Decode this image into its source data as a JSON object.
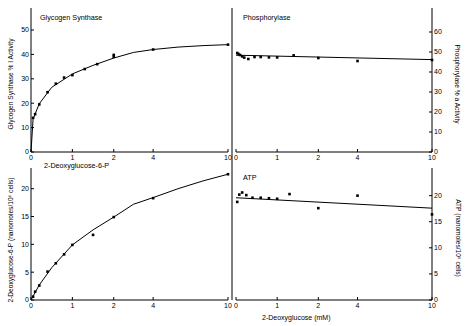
{
  "figure": {
    "background": "#ffffff",
    "ink": "#000000",
    "shared_xlabel": "2-Deoxyglucose (mM)"
  },
  "chart_data": [
    {
      "id": "glycogen-synthase",
      "type": "scatter",
      "title": "Glycogen Synthase",
      "panel": "top-left",
      "xlabel": "2-Deoxyglucose-6-P",
      "ylabel": "Glycogen Synthase % I Activity",
      "xticks": [
        0,
        1,
        2,
        4,
        10
      ],
      "yticks": [
        0,
        10,
        20,
        30,
        40,
        50
      ],
      "xlim": [
        0,
        10
      ],
      "ylim": [
        0,
        50
      ],
      "grid": false,
      "legend": "none",
      "points": [
        {
          "x": 0.05,
          "y": 14.0
        },
        {
          "x": 0.1,
          "y": 15.5
        },
        {
          "x": 0.2,
          "y": 19.5
        },
        {
          "x": 0.4,
          "y": 24.5
        },
        {
          "x": 0.6,
          "y": 28.0
        },
        {
          "x": 0.8,
          "y": 30.5
        },
        {
          "x": 1.0,
          "y": 31.5
        },
        {
          "x": 1.3,
          "y": 34.0
        },
        {
          "x": 1.6,
          "y": 36.0
        },
        {
          "x": 2.0,
          "y": 39.0
        },
        {
          "x": 2.0,
          "y": 39.8
        },
        {
          "x": 4.0,
          "y": 42.0
        },
        {
          "x": 10.0,
          "y": 44.0
        }
      ],
      "curve": [
        {
          "x": 0.0,
          "y": 0.0
        },
        {
          "x": 0.05,
          "y": 13.5
        },
        {
          "x": 0.2,
          "y": 19.8
        },
        {
          "x": 0.5,
          "y": 26.5
        },
        {
          "x": 1.0,
          "y": 32.0
        },
        {
          "x": 1.5,
          "y": 35.5
        },
        {
          "x": 2.0,
          "y": 38.5
        },
        {
          "x": 3.0,
          "y": 40.8
        },
        {
          "x": 4.0,
          "y": 42.0
        },
        {
          "x": 6.0,
          "y": 43.0
        },
        {
          "x": 8.0,
          "y": 43.6
        },
        {
          "x": 10.0,
          "y": 44.0
        }
      ]
    },
    {
      "id": "phosphorylase",
      "type": "scatter",
      "title": "Phosphorylase",
      "panel": "top-right",
      "xlabel": "",
      "ylabel": "Phosphorylase % a Activity",
      "xticks": [
        0,
        1,
        2,
        4,
        10
      ],
      "yticks": [
        0,
        10,
        20,
        30,
        40,
        50,
        60
      ],
      "xlim": [
        0,
        10
      ],
      "ylim": [
        0,
        60
      ],
      "grid": false,
      "legend": "none",
      "points": [
        {
          "x": 0.03,
          "y": 49.5
        },
        {
          "x": 0.06,
          "y": 49.0
        },
        {
          "x": 0.1,
          "y": 48.5
        },
        {
          "x": 0.15,
          "y": 47.8
        },
        {
          "x": 0.2,
          "y": 47.2
        },
        {
          "x": 0.3,
          "y": 46.5
        },
        {
          "x": 0.45,
          "y": 47.5
        },
        {
          "x": 0.6,
          "y": 47.5
        },
        {
          "x": 0.8,
          "y": 47.3
        },
        {
          "x": 1.0,
          "y": 47.3
        },
        {
          "x": 1.4,
          "y": 48.3
        },
        {
          "x": 2.0,
          "y": 47.0
        },
        {
          "x": 4.0,
          "y": 45.5
        },
        {
          "x": 10.0,
          "y": 46.0
        }
      ],
      "curve": [
        {
          "x": 0.0,
          "y": 48.4
        },
        {
          "x": 10.0,
          "y": 46.2
        }
      ]
    },
    {
      "id": "2-deoxyglucose-6-p",
      "type": "scatter",
      "title": "2-Deoxyglucose-6-P",
      "panel": "bottom-left",
      "xlabel": "2-Deoxyglucose (mM)",
      "ylabel": "2-Deoxyglucose-6-P (nanomoles/10⁶ cells)",
      "xticks": [
        0,
        1,
        2,
        4,
        10
      ],
      "yticks": [
        0,
        5,
        10,
        15,
        20
      ],
      "xlim": [
        0,
        10
      ],
      "ylim": [
        0,
        23
      ],
      "grid": false,
      "legend": "none",
      "points": [
        {
          "x": 0.05,
          "y": 0.6
        },
        {
          "x": 0.1,
          "y": 1.5
        },
        {
          "x": 0.2,
          "y": 2.6
        },
        {
          "x": 0.4,
          "y": 5.1
        },
        {
          "x": 0.6,
          "y": 6.6
        },
        {
          "x": 0.8,
          "y": 8.2
        },
        {
          "x": 1.0,
          "y": 9.9
        },
        {
          "x": 1.5,
          "y": 11.7
        },
        {
          "x": 2.0,
          "y": 14.9
        },
        {
          "x": 4.0,
          "y": 18.3
        },
        {
          "x": 10.0,
          "y": 22.6
        }
      ],
      "curve": [
        {
          "x": 0.0,
          "y": 0.0
        },
        {
          "x": 0.2,
          "y": 2.7
        },
        {
          "x": 0.5,
          "y": 5.8
        },
        {
          "x": 1.0,
          "y": 9.9
        },
        {
          "x": 1.5,
          "y": 12.6
        },
        {
          "x": 2.0,
          "y": 14.9
        },
        {
          "x": 3.0,
          "y": 17.2
        },
        {
          "x": 4.0,
          "y": 18.4
        },
        {
          "x": 6.0,
          "y": 20.0
        },
        {
          "x": 8.0,
          "y": 21.4
        },
        {
          "x": 10.0,
          "y": 22.6
        }
      ]
    },
    {
      "id": "atp",
      "type": "scatter",
      "title": "ATP",
      "panel": "bottom-right",
      "xlabel": "2-Deoxyglucose (mM)",
      "ylabel": "ATP (nanomoles/10⁶ cells)",
      "xticks": [
        0,
        1,
        2,
        4,
        10
      ],
      "yticks": [
        0,
        5,
        10,
        15,
        20
      ],
      "xlim": [
        0,
        10
      ],
      "ylim": [
        0,
        23
      ],
      "grid": false,
      "legend": "none",
      "points": [
        {
          "x": 0.03,
          "y": 18.8
        },
        {
          "x": 0.08,
          "y": 20.2
        },
        {
          "x": 0.15,
          "y": 20.6
        },
        {
          "x": 0.25,
          "y": 20.1
        },
        {
          "x": 0.4,
          "y": 19.6
        },
        {
          "x": 0.6,
          "y": 19.6
        },
        {
          "x": 0.8,
          "y": 19.5
        },
        {
          "x": 1.0,
          "y": 19.4
        },
        {
          "x": 1.3,
          "y": 20.3
        },
        {
          "x": 2.0,
          "y": 17.6
        },
        {
          "x": 4.0,
          "y": 20.0
        },
        {
          "x": 10.0,
          "y": 16.4
        }
      ],
      "curve": [
        {
          "x": 0.0,
          "y": 19.6
        },
        {
          "x": 10.0,
          "y": 17.6
        }
      ]
    }
  ]
}
